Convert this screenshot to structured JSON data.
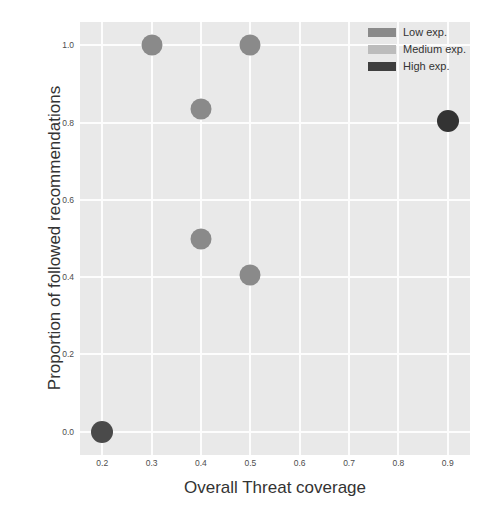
{
  "chart_data": {
    "type": "scatter",
    "title": "",
    "xlabel": "Overall Threat coverage",
    "ylabel": "Proportion of followed recommendations",
    "xlim": [
      0.155,
      0.945
    ],
    "ylim": [
      -0.06,
      1.06
    ],
    "xticks": [
      "0.2",
      "0.3",
      "0.4",
      "0.5",
      "0.6",
      "0.7",
      "0.8",
      "0.9"
    ],
    "xtick_values": [
      0.2,
      0.3,
      0.4,
      0.5,
      0.6,
      0.7,
      0.8,
      0.9
    ],
    "yticks": [
      "0.0",
      "0.2",
      "0.4",
      "0.6",
      "0.8",
      "1.0"
    ],
    "ytick_values": [
      0.0,
      0.2,
      0.4,
      0.6,
      0.8,
      1.0
    ],
    "grid": true,
    "grid_color": "#fdfdfd",
    "panel_color": "#e9e9e9",
    "legend_position": "upper right",
    "series": [
      {
        "name": "Low exp.",
        "color": "#8a8a8a",
        "points": []
      },
      {
        "name": "Medium exp.",
        "color": "#b5b5b5",
        "points": [
          {
            "x": 0.3,
            "y": 1.0
          },
          {
            "x": 0.5,
            "y": 1.0
          },
          {
            "x": 0.4,
            "y": 0.835
          },
          {
            "x": 0.4,
            "y": 0.5
          },
          {
            "x": 0.5,
            "y": 0.405
          }
        ]
      },
      {
        "name": "High exp.",
        "color": "#4a4a4a",
        "points": [
          {
            "x": 0.2,
            "y": 0.0
          },
          {
            "x": 0.9,
            "y": 0.805
          }
        ]
      }
    ],
    "all_points": [
      {
        "x": 0.3,
        "y": 1.0,
        "color": "#8a8a8a",
        "size": 21
      },
      {
        "x": 0.5,
        "y": 1.0,
        "color": "#8a8a8a",
        "size": 21
      },
      {
        "x": 0.4,
        "y": 0.835,
        "color": "#8a8a8a",
        "size": 21
      },
      {
        "x": 0.4,
        "y": 0.5,
        "color": "#8a8a8a",
        "size": 21
      },
      {
        "x": 0.5,
        "y": 0.405,
        "color": "#8a8a8a",
        "size": 21
      },
      {
        "x": 0.2,
        "y": 0.0,
        "color": "#4a4a4a",
        "size": 22
      },
      {
        "x": 0.9,
        "y": 0.805,
        "color": "#333333",
        "size": 22
      }
    ]
  },
  "legend": {
    "entries": [
      {
        "label": "Low exp.",
        "color": "#8a8a8a"
      },
      {
        "label": "Medium exp.",
        "color": "#bcbcbc"
      },
      {
        "label": "High exp.",
        "color": "#3f3f3f"
      }
    ]
  }
}
